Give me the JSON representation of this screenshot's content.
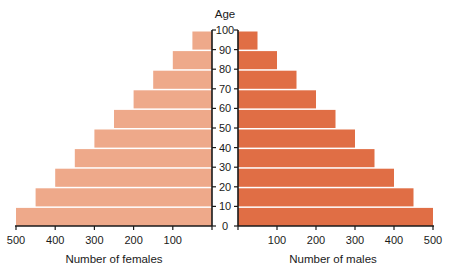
{
  "chart_data": {
    "type": "bar",
    "subtype": "population-pyramid",
    "title": "",
    "center_axis_label": "Age",
    "age_ticks": [
      0,
      10,
      20,
      30,
      40,
      50,
      60,
      70,
      80,
      90,
      100
    ],
    "categories": [
      "0-10",
      "10-20",
      "20-30",
      "30-40",
      "40-50",
      "50-60",
      "60-70",
      "70-80",
      "80-90",
      "90-100"
    ],
    "series": [
      {
        "name": "Females",
        "side": "left",
        "color": "#eea98a",
        "values": [
          500,
          450,
          400,
          350,
          300,
          250,
          200,
          150,
          100,
          50
        ]
      },
      {
        "name": "Males",
        "side": "right",
        "color": "#e06e45",
        "values": [
          500,
          450,
          400,
          350,
          300,
          250,
          200,
          150,
          100,
          50
        ]
      }
    ],
    "left_axis": {
      "label": "Number of females",
      "ticks": [
        500,
        400,
        300,
        200,
        100
      ],
      "range": [
        500,
        0
      ]
    },
    "right_axis": {
      "label": "Number of males",
      "ticks": [
        100,
        200,
        300,
        400,
        500
      ],
      "range": [
        0,
        500
      ]
    },
    "grid": false,
    "legend": "none"
  }
}
